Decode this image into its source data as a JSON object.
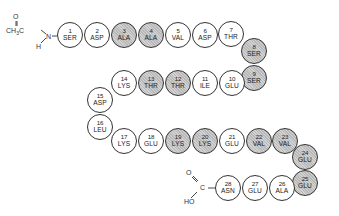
{
  "diagram": {
    "title": "",
    "n_terminus": {
      "group": "acetyl",
      "labels": {
        "o": "O",
        "ch3": "CH3",
        "ch3_main": "CH",
        "ch3_sub": "3",
        "c": "C",
        "n": "N",
        "h": "H"
      }
    },
    "c_terminus": {
      "group": "carboxyl",
      "labels": {
        "o": "O",
        "c": "C",
        "ho": "HO"
      }
    },
    "shade_color": "#c4c4c4",
    "residues": [
      {
        "num": "1",
        "aa": "SER",
        "shaded": false,
        "x": 70,
        "y": 35
      },
      {
        "num": "2",
        "aa": "ASP",
        "shaded": false,
        "x": 97,
        "y": 35
      },
      {
        "num": "3",
        "aa": "ALA",
        "shaded": true,
        "x": 124,
        "y": 35
      },
      {
        "num": "4",
        "aa": "ALA",
        "shaded": true,
        "x": 151,
        "y": 35
      },
      {
        "num": "5",
        "aa": "VAL",
        "shaded": false,
        "x": 178,
        "y": 35
      },
      {
        "num": "6",
        "aa": "ASP",
        "shaded": false,
        "x": 205,
        "y": 35
      },
      {
        "num": "7",
        "aa": "THR",
        "shaded": false,
        "x": 231,
        "y": 34
      },
      {
        "num": "8",
        "aa": "SER",
        "shaded": true,
        "x": 254,
        "y": 51
      },
      {
        "num": "9",
        "aa": "SER",
        "shaded": true,
        "x": 254,
        "y": 78
      },
      {
        "num": "10",
        "aa": "GLU",
        "shaded": false,
        "x": 232,
        "y": 83
      },
      {
        "num": "11",
        "aa": "ILE",
        "shaded": false,
        "x": 205,
        "y": 83
      },
      {
        "num": "12",
        "aa": "THR",
        "shaded": true,
        "x": 178,
        "y": 83
      },
      {
        "num": "13",
        "aa": "THR",
        "shaded": true,
        "x": 151,
        "y": 83
      },
      {
        "num": "14",
        "aa": "LYS",
        "shaded": false,
        "x": 124,
        "y": 83
      },
      {
        "num": "15",
        "aa": "ASP",
        "shaded": false,
        "x": 100,
        "y": 100
      },
      {
        "num": "16",
        "aa": "LEU",
        "shaded": false,
        "x": 100,
        "y": 127
      },
      {
        "num": "17",
        "aa": "LYS",
        "shaded": false,
        "x": 124,
        "y": 141
      },
      {
        "num": "18",
        "aa": "GLU",
        "shaded": false,
        "x": 151,
        "y": 141
      },
      {
        "num": "19",
        "aa": "LYS",
        "shaded": true,
        "x": 178,
        "y": 141
      },
      {
        "num": "20",
        "aa": "LYS",
        "shaded": true,
        "x": 205,
        "y": 141
      },
      {
        "num": "21",
        "aa": "GLU",
        "shaded": false,
        "x": 232,
        "y": 141
      },
      {
        "num": "22",
        "aa": "VAL",
        "shaded": true,
        "x": 259,
        "y": 141
      },
      {
        "num": "23",
        "aa": "VAL",
        "shaded": true,
        "x": 285,
        "y": 141
      },
      {
        "num": "24",
        "aa": "GLU",
        "shaded": true,
        "x": 305,
        "y": 157
      },
      {
        "num": "25",
        "aa": "GLU",
        "shaded": true,
        "x": 305,
        "y": 183
      },
      {
        "num": "26",
        "aa": "ALA",
        "shaded": false,
        "x": 282,
        "y": 188
      },
      {
        "num": "27",
        "aa": "GLU",
        "shaded": false,
        "x": 255,
        "y": 188
      },
      {
        "num": "28",
        "aa": "ASN",
        "shaded": false,
        "x": 228,
        "y": 188
      }
    ]
  }
}
